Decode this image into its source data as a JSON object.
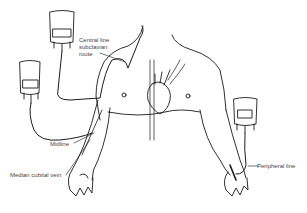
{
  "diagram": {
    "labels": {
      "central_line": [
        "Central line",
        "subclavian",
        "route"
      ],
      "midline": "Midline",
      "median_cubital_vein": "Median cubital vein",
      "peripheral_line": "Peripheral line"
    },
    "colors": {
      "line": "#1a1a1a",
      "label": "#444444",
      "background": "#ffffff"
    },
    "elements": [
      "iv-bag-central",
      "iv-bag-midline",
      "iv-bag-peripheral",
      "torso",
      "heart",
      "left-arm",
      "right-arm"
    ]
  }
}
